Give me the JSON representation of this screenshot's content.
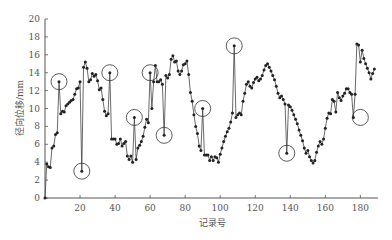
{
  "chart_data": {
    "type": "line",
    "title": "",
    "xlabel": "记录号",
    "ylabel": "径向位移/mm",
    "xlim": [
      0,
      190
    ],
    "ylim": [
      0,
      20
    ],
    "x_ticks": [
      20,
      40,
      60,
      80,
      100,
      120,
      140,
      160,
      180
    ],
    "y_ticks": [
      0,
      2,
      4,
      6,
      8,
      10,
      12,
      14,
      16,
      18,
      20
    ],
    "grid": false,
    "legend": null,
    "marker": "filled-circle",
    "series": [
      {
        "name": "径向位移",
        "x_start": 0,
        "values": [
          0,
          3.8,
          3.5,
          3.4,
          5.6,
          5.8,
          7.1,
          7.3,
          13.0,
          9.4,
          9.7,
          9.6,
          10.3,
          10.5,
          10.7,
          10.9,
          11.0,
          11.6,
          12.2,
          12.3,
          13.0,
          3.0,
          14.6,
          15.2,
          14.5,
          13.0,
          13.2,
          13.9,
          13.6,
          13.8,
          13.1,
          12.1,
          12.3,
          11.0,
          9.7,
          9.2,
          9.4,
          14.0,
          6.6,
          6.6,
          6.6,
          6.0,
          6.1,
          6.6,
          5.8,
          6.1,
          6.3,
          4.7,
          4.3,
          4.7,
          4.0,
          9.0,
          4.3,
          5.6,
          5.9,
          6.3,
          6.9,
          7.9,
          8.8,
          8.4,
          14.0,
          10.0,
          13.0,
          14.8,
          13.0,
          13.0,
          13.2,
          12.7,
          7.0,
          13.7,
          13.4,
          13.8,
          15.5,
          15.9,
          15.2,
          15.3,
          14.2,
          13.8,
          14.2,
          14.9,
          15.0,
          15.3,
          13.8,
          11.8,
          10.8,
          9.3,
          8.0,
          7.2,
          5.8,
          5.3,
          10.0,
          4.8,
          4.8,
          4.8,
          4.2,
          4.6,
          4.2,
          4.6,
          4.5,
          4.0,
          4.9,
          5.6,
          6.3,
          6.9,
          7.4,
          7.8,
          8.5,
          9.5,
          17.0,
          9.0,
          9.3,
          9.5,
          9.3,
          10.8,
          11.7,
          12.7,
          13.0,
          12.5,
          12.3,
          12.9,
          13.3,
          13.5,
          13.1,
          13.3,
          13.7,
          14.3,
          14.8,
          15.0,
          14.6,
          14.2,
          13.7,
          13.2,
          12.5,
          11.7,
          11.2,
          11.4,
          11.0,
          10.5,
          5.0,
          10.4,
          10.2,
          9.8,
          9.3,
          8.8,
          8.3,
          7.6,
          7.0,
          6.4,
          5.6,
          5.0,
          5.3,
          4.6,
          4.2,
          3.9,
          4.2,
          5.1,
          5.8,
          6.3,
          6.0,
          6.6,
          7.8,
          8.9,
          9.5,
          9.4,
          11.0,
          10.8,
          9.6,
          11.8,
          11.2,
          10.9,
          11.4,
          11.7,
          12.2,
          12.2,
          11.8,
          11.6,
          9.0,
          11.6,
          17.2,
          17.1,
          15.2,
          16.5,
          15.6,
          15.0,
          14.5,
          14.0,
          13.3,
          13.9,
          14.4
        ]
      }
    ],
    "annotations": [
      {
        "shape": "circle",
        "x": 8,
        "y": 13.0
      },
      {
        "shape": "circle",
        "x": 21,
        "y": 3.0
      },
      {
        "shape": "circle",
        "x": 37,
        "y": 14.0
      },
      {
        "shape": "circle",
        "x": 51,
        "y": 9.0
      },
      {
        "shape": "circle",
        "x": 60,
        "y": 14.0
      },
      {
        "shape": "circle",
        "x": 68,
        "y": 7.0
      },
      {
        "shape": "circle",
        "x": 90,
        "y": 10.0
      },
      {
        "shape": "circle",
        "x": 108,
        "y": 17.0
      },
      {
        "shape": "circle",
        "x": 138,
        "y": 5.0
      },
      {
        "shape": "circle",
        "x": 180,
        "y": 9.0
      }
    ]
  }
}
